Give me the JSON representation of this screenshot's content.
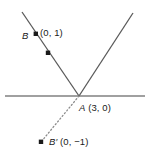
{
  "figure": {
    "type": "geometry-diagram",
    "background_color": "#ffffff",
    "line_color": "#595959",
    "axis_color": "#808080",
    "point_color": "#1a1a1a",
    "text_color": "#1a1a1a"
  },
  "labels": {
    "b_point": "B",
    "b_coord": "(0, 1)",
    "a_point": "A",
    "a_coord": "(3, 0)",
    "bprime_point": "B′",
    "bprime_coord": "(0, −1)"
  },
  "geometry": {
    "horizontal_line": {
      "x1": 5,
      "y1": 96,
      "x2": 145,
      "y2": 96
    },
    "left_ray": {
      "x1": 22,
      "y1": 12,
      "x2": 79,
      "y2": 96
    },
    "right_ray": {
      "x1": 79,
      "y1": 96,
      "x2": 133,
      "y2": 13
    },
    "dotted_ray": {
      "x1": 79,
      "y1": 96,
      "x2": 41,
      "y2": 142
    },
    "points": [
      {
        "name": "B",
        "x": 36,
        "y": 34
      },
      {
        "name": "midpoint-marker",
        "x": 48,
        "y": 53
      },
      {
        "name": "B-prime",
        "x": 41,
        "y": 142
      }
    ]
  }
}
